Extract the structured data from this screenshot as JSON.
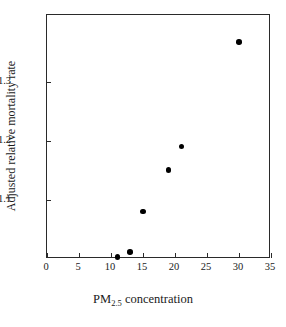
{
  "figure": {
    "background_color": "#ffffff",
    "frame_color": "#2a2a2a",
    "marker_color": "#000000"
  },
  "chart_data": {
    "type": "scatter",
    "title": "",
    "xlabel_text": "PM",
    "xlabel_sub": "2.5",
    "xlabel_rest": " concentration",
    "xlabel": "PM2.5 concentration",
    "ylabel": "Adjusted relative mortality rate",
    "xlim": [
      0,
      35
    ],
    "ylim": [
      1.0,
      1.414
    ],
    "grid": false,
    "legend": "none",
    "xticks": [
      0,
      5,
      10,
      15,
      20,
      25,
      30,
      35
    ],
    "xtick_labels": [
      "0",
      "5",
      "10",
      "15",
      "20",
      "25",
      "30",
      "35"
    ],
    "yticks": [
      1.1,
      1.2,
      1.3
    ],
    "ytick_labels": [
      "1.1",
      "1.2",
      "1.3"
    ],
    "x": [
      11,
      13,
      15,
      19,
      21,
      30
    ],
    "y": [
      1.003,
      1.012,
      1.081,
      1.151,
      1.191,
      1.368
    ],
    "points": [
      {
        "x": 11,
        "y": 1.003
      },
      {
        "x": 13,
        "y": 1.012
      },
      {
        "x": 15,
        "y": 1.081
      },
      {
        "x": 19,
        "y": 1.151
      },
      {
        "x": 21,
        "y": 1.191
      },
      {
        "x": 30,
        "y": 1.368
      }
    ]
  }
}
